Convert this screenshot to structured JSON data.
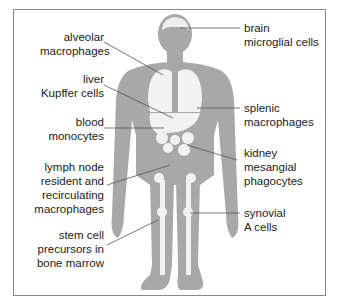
{
  "colors": {
    "body": "#a8a8a8",
    "organ": "#f2f2f2",
    "line": "#555555",
    "frame": "#8a8a8a"
  },
  "labels": {
    "alveolar": [
      "alveolar",
      "macrophages"
    ],
    "liver": [
      "liver",
      "Kupffer cells"
    ],
    "blood": [
      "blood",
      "monocytes"
    ],
    "lymph": [
      "lymph node",
      "resident and",
      "recirculating",
      "macrophages"
    ],
    "stem": [
      "stem cell",
      "precursors in",
      "bone marrow"
    ],
    "brain": [
      "brain",
      "microglial cells"
    ],
    "splenic": [
      "splenic",
      "macrophages"
    ],
    "kidney": [
      "kidney",
      "mesangial",
      "phagocytes"
    ],
    "synovial": [
      "synovial",
      "A cells"
    ]
  }
}
